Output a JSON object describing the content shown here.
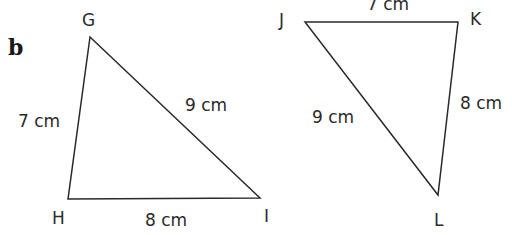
{
  "part_label": "b",
  "triangles": [
    {
      "name": "GHI",
      "vertices": {
        "G": "G",
        "H": "H",
        "I": "I"
      },
      "sides": {
        "GH": "7 cm",
        "GI": "9 cm",
        "HI": "8 cm"
      }
    },
    {
      "name": "JKL",
      "vertices": {
        "J": "J",
        "K": "K",
        "L": "L"
      },
      "sides": {
        "JK": "7 cm",
        "KL": "8 cm",
        "JL": "9 cm"
      }
    }
  ],
  "colors": {
    "stroke": "#2a2a2a",
    "background": "#ffffff"
  }
}
